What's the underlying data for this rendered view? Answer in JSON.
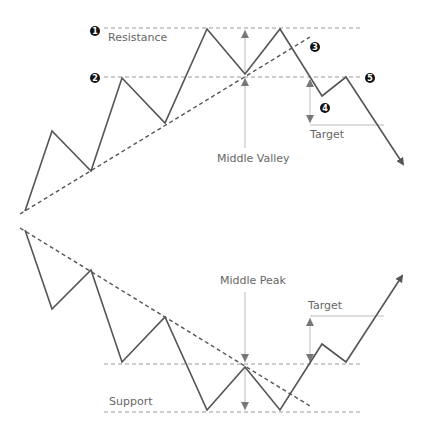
{
  "diagram": {
    "top": {
      "title": "Double top breakdown",
      "labels": {
        "resistance": "Resistance",
        "middle_valley": "Middle Valley",
        "target": "Target"
      },
      "markers": [
        "1",
        "2",
        "3",
        "4",
        "5"
      ]
    },
    "bottom": {
      "title": "Double bottom breakout",
      "labels": {
        "middle_peak": "Middle Peak",
        "target": "Target",
        "support": "Support"
      }
    },
    "colors": {
      "price_line": "#555555",
      "dashed_line": "#999999",
      "arrow_line": "#bbbbbb",
      "marker_bg": "#111111"
    }
  }
}
